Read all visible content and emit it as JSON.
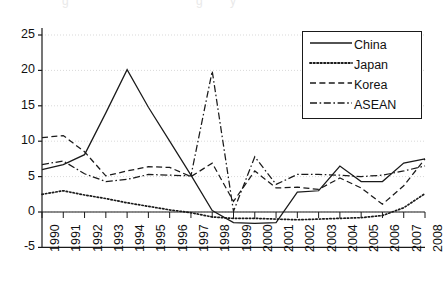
{
  "figure": {
    "background": "#ffffff",
    "axis_color": "#1a1a1a",
    "grid_color": "#d9d9d9",
    "series_color": "#1a1a1a"
  },
  "legend": {
    "position": "top-right",
    "entries": [
      {
        "label": "China",
        "style": "solid"
      },
      {
        "label": "Japan",
        "style": "dotted"
      },
      {
        "label": "Korea",
        "style": "dashed"
      },
      {
        "label": "ASEAN",
        "style": "dashdot"
      }
    ]
  },
  "axes": {
    "y_ticks": [
      "25",
      "20",
      "15",
      "10",
      "5",
      "0",
      "-5"
    ],
    "x_ticks": [
      "1990",
      "1991",
      "1992",
      "1993",
      "1994",
      "1995",
      "1996",
      "1997",
      "1998",
      "1999",
      "2000",
      "2001",
      "2002",
      "2003",
      "2004",
      "2005",
      "2006",
      "2007",
      "2008"
    ]
  },
  "chart_data": {
    "type": "line",
    "title": "",
    "subtitle": "",
    "xlabel": "",
    "ylabel": "",
    "xlim": [
      1990,
      2008
    ],
    "ylim": [
      -5,
      25
    ],
    "y_ticks": [
      -5,
      0,
      5,
      10,
      15,
      20,
      25
    ],
    "grid": "horizontal-dotted",
    "legend_position": "top-right",
    "x": [
      1990,
      1991,
      1992,
      1993,
      1994,
      1995,
      1996,
      1997,
      1998,
      1999,
      2000,
      2001,
      2002,
      2003,
      2004,
      2005,
      2006,
      2007,
      2008
    ],
    "series": [
      {
        "name": "China",
        "style": "solid",
        "values": [
          6.0,
          6.7,
          8.1,
          14.0,
          20.1,
          14.8,
          10.0,
          5.2,
          0.2,
          -1.5,
          -1.6,
          -1.5,
          2.8,
          3.0,
          6.5,
          4.3,
          4.3,
          6.9,
          7.5
        ]
      },
      {
        "name": "Japan",
        "style": "dotted",
        "values": [
          2.5,
          3.0,
          2.4,
          1.9,
          1.3,
          0.8,
          0.3,
          -0.1,
          -0.7,
          -0.9,
          -0.9,
          -1.0,
          -1.1,
          -1.0,
          -0.9,
          -0.8,
          -0.5,
          0.6,
          2.6
        ]
      },
      {
        "name": "Korea",
        "style": "dashed",
        "values": [
          10.5,
          10.8,
          8.5,
          5.1,
          5.8,
          6.4,
          6.3,
          5.0,
          6.9,
          1.5,
          5.8,
          3.4,
          3.5,
          3.2,
          4.8,
          3.4,
          1.1,
          3.7,
          7.5
        ]
      },
      {
        "name": "ASEAN",
        "style": "dashdot",
        "values": [
          6.7,
          7.2,
          5.4,
          4.3,
          4.6,
          5.3,
          5.2,
          5.1,
          19.9,
          0.1,
          7.8,
          3.9,
          5.3,
          5.3,
          5.2,
          5.0,
          5.2,
          5.8,
          6.5
        ]
      }
    ]
  }
}
